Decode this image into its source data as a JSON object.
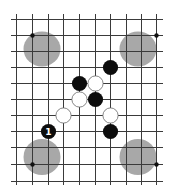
{
  "diagram": {
    "type": "go-board-fragment",
    "grid": {
      "columns_x": [
        16,
        32,
        48,
        63,
        79,
        95,
        110,
        126,
        141,
        156
      ],
      "rows_y": [
        19,
        35,
        51,
        67,
        83,
        99,
        115,
        131,
        147,
        164,
        181
      ],
      "line_extent": {
        "x_min": 11,
        "x_max": 163,
        "y_min": 14,
        "y_max": 185
      },
      "line_color": "#3a3a3a"
    },
    "star_points": [
      {
        "col": 1,
        "row": 1
      },
      {
        "col": 9,
        "row": 1
      },
      {
        "col": 1,
        "row": 9
      },
      {
        "col": 9,
        "row": 9
      }
    ],
    "highlight_zones": [
      {
        "name": "top-left-zone",
        "cx": 42,
        "cy": 49,
        "rx": 18.5,
        "ry": 17.5,
        "color": "#a8a8a8"
      },
      {
        "name": "top-right-zone",
        "cx": 138,
        "cy": 49,
        "rx": 18.5,
        "ry": 17.5,
        "color": "#a8a8a8"
      },
      {
        "name": "bottom-left-zone",
        "cx": 42,
        "cy": 157,
        "rx": 18.5,
        "ry": 18,
        "color": "#a8a8a8"
      },
      {
        "name": "bottom-right-zone",
        "cx": 138,
        "cy": 157,
        "rx": 18.5,
        "ry": 18,
        "color": "#a8a8a8"
      }
    ],
    "stones": [
      {
        "color": "black",
        "col": 6,
        "row": 3,
        "label": ""
      },
      {
        "color": "black",
        "col": 4,
        "row": 4,
        "label": ""
      },
      {
        "color": "white",
        "col": 5,
        "row": 4,
        "label": ""
      },
      {
        "color": "white",
        "col": 4,
        "row": 5,
        "label": ""
      },
      {
        "color": "black",
        "col": 5,
        "row": 5,
        "label": ""
      },
      {
        "color": "white",
        "col": 3,
        "row": 6,
        "label": ""
      },
      {
        "color": "white",
        "col": 6,
        "row": 6,
        "label": ""
      },
      {
        "color": "black",
        "col": 2,
        "row": 7,
        "label": "1"
      },
      {
        "color": "black",
        "col": 6,
        "row": 7,
        "label": ""
      }
    ],
    "stone_radius": 7.6
  }
}
